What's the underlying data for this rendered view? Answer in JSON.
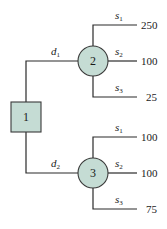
{
  "diagram": {
    "type": "decision-tree",
    "colors": {
      "node_fill": "#c5dcd4",
      "stroke": "#2a2a2a"
    },
    "decision_node": {
      "id": "1",
      "label": "1"
    },
    "decisions": [
      {
        "label": "d",
        "sub": "1",
        "chance_node": {
          "id": "2",
          "label": "2"
        },
        "outcomes": [
          {
            "state": "s",
            "sub": "1",
            "payoff": "250"
          },
          {
            "state": "s",
            "sub": "2",
            "payoff": "100"
          },
          {
            "state": "s",
            "sub": "3",
            "payoff": "25"
          }
        ]
      },
      {
        "label": "d",
        "sub": "2",
        "chance_node": {
          "id": "3",
          "label": "3"
        },
        "outcomes": [
          {
            "state": "s",
            "sub": "1",
            "payoff": "100"
          },
          {
            "state": "s",
            "sub": "2",
            "payoff": "100"
          },
          {
            "state": "s",
            "sub": "3",
            "payoff": "75"
          }
        ]
      }
    ]
  }
}
